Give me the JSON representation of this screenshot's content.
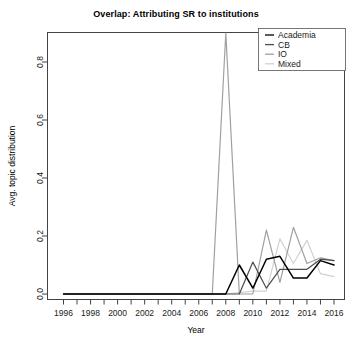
{
  "chart_data": {
    "type": "line",
    "title": "Overlap: Attributing SR to institutions",
    "xlabel": "Year",
    "ylabel": "Avg. topic distribution",
    "xlim": [
      1995,
      2017
    ],
    "ylim": [
      0.0,
      0.93
    ],
    "grid": false,
    "legend_position": "top-right",
    "x_ticks": [
      1996,
      1998,
      2000,
      2002,
      2004,
      2006,
      2008,
      2010,
      2012,
      2014,
      2016
    ],
    "x_tick_labels": [
      "1996",
      "1998",
      "2000",
      "2002",
      "2004",
      "2006",
      "2008",
      "2010",
      "2012",
      "2014",
      "2016"
    ],
    "x_minor_ticks": [
      1997,
      1999,
      2001,
      2003,
      2005,
      2007,
      2009,
      2011,
      2013,
      2015
    ],
    "y_ticks": [
      0.0,
      0.2,
      0.4,
      0.6,
      0.8
    ],
    "y_tick_labels": [
      "0.0",
      "0.2",
      "0.4",
      "0.6",
      "0.8"
    ],
    "x": [
      1996,
      1997,
      1998,
      1999,
      2000,
      2001,
      2002,
      2003,
      2004,
      2005,
      2006,
      2007,
      2008,
      2009,
      2010,
      2011,
      2012,
      2013,
      2014,
      2015,
      2016
    ],
    "series": [
      {
        "name": "Academia",
        "color": "#000000",
        "values": [
          0.0,
          0.0,
          0.0,
          0.0,
          0.0,
          0.0,
          0.0,
          0.0,
          0.0,
          0.0,
          0.0,
          0.0,
          0.0,
          0.1,
          0.02,
          0.12,
          0.13,
          0.055,
          0.055,
          0.115,
          0.1
        ]
      },
      {
        "name": "CB",
        "color": "#4d4d4d",
        "values": [
          0.0,
          0.0,
          0.0,
          0.0,
          0.0,
          0.0,
          0.0,
          0.0,
          0.0,
          0.0,
          0.0,
          0.0,
          0.0,
          0.0,
          0.11,
          0.02,
          0.085,
          0.085,
          0.085,
          0.12,
          0.115
        ]
      },
      {
        "name": "IO",
        "color": "#a0a0a0",
        "values": [
          0.0,
          0.0,
          0.0,
          0.0,
          0.0,
          0.0,
          0.0,
          0.0,
          0.0,
          0.0,
          0.0,
          0.0,
          0.9,
          0.0,
          0.0,
          0.22,
          0.04,
          0.23,
          0.105,
          0.125,
          0.115
        ]
      },
      {
        "name": "Mixed",
        "color": "#d2d2d2",
        "values": [
          0.0,
          0.0,
          0.0,
          0.0,
          0.0,
          0.0,
          0.0,
          0.0,
          0.0,
          0.0,
          0.0,
          0.0,
          0.0,
          0.005,
          0.01,
          0.01,
          0.19,
          0.105,
          0.185,
          0.07,
          0.06
        ]
      }
    ]
  },
  "legend": {
    "entries": [
      {
        "label": "Academia"
      },
      {
        "label": "CB"
      },
      {
        "label": "IO"
      },
      {
        "label": "Mixed"
      }
    ]
  }
}
